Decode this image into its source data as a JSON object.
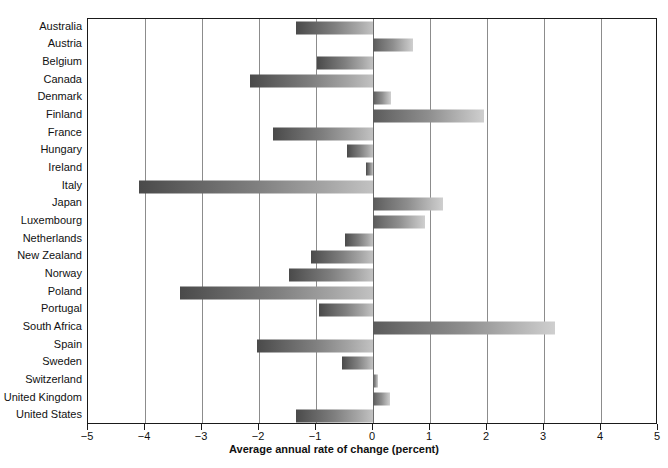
{
  "chart_data": {
    "type": "bar",
    "orientation": "horizontal",
    "title": "",
    "xlabel": "Average annual rate of change (percent)",
    "ylabel": "",
    "xlim": [
      -5,
      5
    ],
    "xticks": [
      -5,
      -4,
      -3,
      -2,
      -1,
      0,
      1,
      2,
      3,
      4,
      5
    ],
    "xticklabels": [
      "−5",
      "−4",
      "−3",
      "−2",
      "−1",
      "0",
      "1",
      "2",
      "3",
      "4",
      "5"
    ],
    "grid": "vertical",
    "legend": "none",
    "categories": [
      "Australia",
      "Austria",
      "Belgium",
      "Canada",
      "Denmark",
      "Finland",
      "France",
      "Hungary",
      "Ireland",
      "Italy",
      "Japan",
      "Luxembourg",
      "Netherlands",
      "New Zealand",
      "Norway",
      "Poland",
      "Portugal",
      "South Africa",
      "Spain",
      "Sweden",
      "Switzerland",
      "United Kingdom",
      "United States"
    ],
    "values": [
      -1.35,
      0.7,
      -0.98,
      -2.15,
      0.32,
      1.95,
      -1.75,
      -0.45,
      -0.12,
      -4.1,
      1.23,
      0.91,
      -0.49,
      -1.09,
      -1.47,
      -3.38,
      -0.95,
      3.2,
      -2.03,
      -0.55,
      0.08,
      0.3,
      -1.35
    ],
    "bar_gradient": {
      "negative_start": "#4a4a4a",
      "negative_end": "#c2c2c2",
      "positive_start": "#5b5b5b",
      "positive_end": "#cfcfcf"
    },
    "axis_color": "#1a1a1a",
    "grid_color": "#8c8c8c"
  }
}
